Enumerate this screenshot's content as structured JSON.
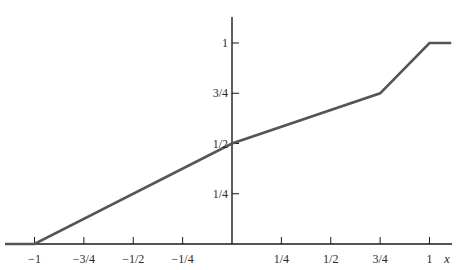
{
  "chart_data": {
    "type": "line",
    "title": "",
    "xlabel": "x",
    "ylabel": "",
    "xlim": [
      -1.22,
      1.11
    ],
    "ylim": [
      0,
      1.15
    ],
    "grid": false,
    "legend": null,
    "x_ticks": [
      {
        "value": -1,
        "label": "−1"
      },
      {
        "value": -0.75,
        "label": "−3/4"
      },
      {
        "value": -0.5,
        "label": "−1/2"
      },
      {
        "value": -0.25,
        "label": "−1/4"
      },
      {
        "value": 0.25,
        "label": "1/4"
      },
      {
        "value": 0.5,
        "label": "1/2"
      },
      {
        "value": 0.75,
        "label": "3/4"
      },
      {
        "value": 1,
        "label": "1"
      }
    ],
    "y_ticks": [
      {
        "value": 0.25,
        "label": "1/4"
      },
      {
        "value": 0.5,
        "label": "1/2"
      },
      {
        "value": 0.75,
        "label": "3/4"
      },
      {
        "value": 1,
        "label": "1"
      }
    ],
    "series": [
      {
        "name": "piecewise linear function",
        "color": "#555555",
        "x": [
          -1.22,
          -1,
          0,
          0.75,
          1,
          1.11
        ],
        "y": [
          0,
          0,
          0.5,
          0.75,
          1,
          1
        ]
      }
    ]
  },
  "colors": {
    "axis": "#1a1a1a",
    "curve": "#555555",
    "text": "#2a2a2a",
    "background": "#ffffff"
  }
}
